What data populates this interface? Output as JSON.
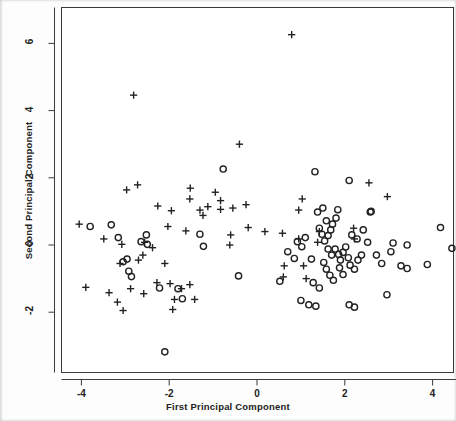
{
  "chart_data": {
    "type": "scatter",
    "title": "",
    "xlabel": "First Principal Component",
    "ylabel": "Second Principal Component",
    "xlim": [
      -4.45,
      4.45
    ],
    "ylim": [
      -3.9,
      6.9
    ],
    "xticks": [
      -4,
      -2,
      0,
      2,
      4
    ],
    "xticklabels": [
      "-4",
      "-2",
      "0",
      "2",
      "4"
    ],
    "yticks": [
      -2,
      0,
      2,
      4,
      6
    ],
    "yticklabels": [
      "-2",
      "0",
      "2",
      "4",
      "6"
    ],
    "grid": false,
    "legend": null,
    "frame": "box",
    "marker_color": "#222222",
    "background_color": "#ffffff",
    "series": [
      {
        "name": "group-plus",
        "marker": "plus",
        "points": [
          [
            -2.81,
            4.46
          ],
          [
            0.79,
            6.26
          ],
          [
            -0.4,
            3.0
          ],
          [
            -2.97,
            1.64
          ],
          [
            -2.72,
            1.79
          ],
          [
            -1.52,
            1.69
          ],
          [
            -1.53,
            1.37
          ],
          [
            -0.95,
            1.57
          ],
          [
            -1.12,
            1.14
          ],
          [
            -1.3,
            1.04
          ],
          [
            -1.23,
            0.88
          ],
          [
            -0.83,
            1.06
          ],
          [
            -0.83,
            1.32
          ],
          [
            -1.95,
            1.02
          ],
          [
            -2.26,
            1.16
          ],
          [
            -0.55,
            1.1
          ],
          [
            -0.25,
            1.2
          ],
          [
            2.55,
            1.85
          ],
          [
            2.97,
            1.44
          ],
          [
            1.03,
            1.37
          ],
          [
            0.95,
            1.04
          ],
          [
            -4.05,
            0.62
          ],
          [
            -3.49,
            0.18
          ],
          [
            -3.08,
            0.02
          ],
          [
            -2.56,
            0.08
          ],
          [
            -2.03,
            0.55
          ],
          [
            -2.38,
            -0.08
          ],
          [
            -2.6,
            -0.3
          ],
          [
            -2.7,
            -0.45
          ],
          [
            -3.12,
            -0.55
          ],
          [
            -2.1,
            -0.55
          ],
          [
            -1.62,
            0.42
          ],
          [
            -0.6,
            0.3
          ],
          [
            -0.2,
            0.52
          ],
          [
            0.18,
            0.4
          ],
          [
            0.58,
            0.35
          ],
          [
            0.95,
            0.18
          ],
          [
            1.42,
            0.4
          ],
          [
            1.38,
            0.08
          ],
          [
            2.2,
            0.5
          ],
          [
            2.22,
            0.18
          ],
          [
            -3.9,
            -1.26
          ],
          [
            -3.37,
            -1.42
          ],
          [
            -3.18,
            -1.7
          ],
          [
            -3.05,
            -1.95
          ],
          [
            -2.88,
            -1.3
          ],
          [
            -2.58,
            -1.45
          ],
          [
            -2.28,
            -1.12
          ],
          [
            -1.98,
            -1.15
          ],
          [
            -1.72,
            -1.3
          ],
          [
            -1.88,
            -1.62
          ],
          [
            -1.92,
            -1.92
          ],
          [
            -1.53,
            -1.18
          ],
          [
            -1.42,
            -1.62
          ],
          [
            -0.62,
            0.0
          ],
          [
            0.62,
            -0.62
          ],
          [
            0.6,
            -0.95
          ],
          [
            1.06,
            -0.62
          ],
          [
            1.12,
            -1.0
          ]
        ]
      },
      {
        "name": "group-circle",
        "marker": "circle",
        "points": [
          [
            -0.77,
            2.26
          ],
          [
            1.32,
            2.18
          ],
          [
            2.1,
            1.92
          ],
          [
            2.58,
            0.98
          ],
          [
            -3.32,
            0.6
          ],
          [
            -3.16,
            0.22
          ],
          [
            -2.64,
            0.1
          ],
          [
            -2.52,
            0.3
          ],
          [
            -2.5,
            0.02
          ],
          [
            -2.96,
            -0.42
          ],
          [
            -2.92,
            -0.78
          ],
          [
            -2.86,
            -0.94
          ],
          [
            -3.05,
            -0.5
          ],
          [
            -3.8,
            0.55
          ],
          [
            -2.22,
            -1.28
          ],
          [
            -1.8,
            -1.3
          ],
          [
            -1.7,
            -1.6
          ],
          [
            -2.1,
            -3.18
          ],
          [
            -1.3,
            0.32
          ],
          [
            -1.22,
            -0.04
          ],
          [
            -0.42,
            -0.92
          ],
          [
            0.52,
            -1.08
          ],
          [
            0.7,
            -0.2
          ],
          [
            1.0,
            -1.65
          ],
          [
            1.18,
            -1.78
          ],
          [
            1.34,
            -1.82
          ],
          [
            1.38,
            0.98
          ],
          [
            1.5,
            1.1
          ],
          [
            1.58,
            0.72
          ],
          [
            1.42,
            0.5
          ],
          [
            1.48,
            0.32
          ],
          [
            1.54,
            0.12
          ],
          [
            1.62,
            0.28
          ],
          [
            1.68,
            0.45
          ],
          [
            1.72,
            0.62
          ],
          [
            1.8,
            0.8
          ],
          [
            1.84,
            1.05
          ],
          [
            1.62,
            -0.12
          ],
          [
            1.7,
            -0.3
          ],
          [
            1.78,
            -0.12
          ],
          [
            1.86,
            -0.28
          ],
          [
            1.9,
            -0.45
          ],
          [
            1.96,
            -0.22
          ],
          [
            2.02,
            -0.06
          ],
          [
            2.08,
            -0.38
          ],
          [
            1.52,
            -0.52
          ],
          [
            1.58,
            -0.72
          ],
          [
            1.66,
            -0.9
          ],
          [
            1.74,
            -1.05
          ],
          [
            1.88,
            -0.68
          ],
          [
            1.96,
            -0.88
          ],
          [
            2.12,
            -0.6
          ],
          [
            2.22,
            -0.72
          ],
          [
            2.3,
            -0.45
          ],
          [
            2.38,
            -0.3
          ],
          [
            2.16,
            0.3
          ],
          [
            2.28,
            0.18
          ],
          [
            2.42,
            0.45
          ],
          [
            2.52,
            0.08
          ],
          [
            2.72,
            -0.3
          ],
          [
            2.84,
            -0.55
          ],
          [
            3.05,
            -0.2
          ],
          [
            3.28,
            -0.62
          ],
          [
            3.42,
            -0.7
          ],
          [
            3.88,
            -0.58
          ],
          [
            4.18,
            0.52
          ],
          [
            4.44,
            -0.1
          ],
          [
            2.96,
            -1.48
          ],
          [
            2.1,
            -1.78
          ],
          [
            2.22,
            -1.85
          ],
          [
            1.42,
            -1.28
          ],
          [
            1.28,
            -1.12
          ],
          [
            0.92,
            0.1
          ],
          [
            1.02,
            -0.05
          ],
          [
            1.1,
            0.22
          ],
          [
            1.24,
            -0.42
          ],
          [
            0.85,
            -0.4
          ],
          [
            2.6,
            1.0
          ],
          [
            3.1,
            0.06
          ],
          [
            3.42,
            0.0
          ]
        ]
      }
    ]
  },
  "axes": {
    "x_title": "First Principal Component",
    "y_title": "Second Principal Component"
  }
}
